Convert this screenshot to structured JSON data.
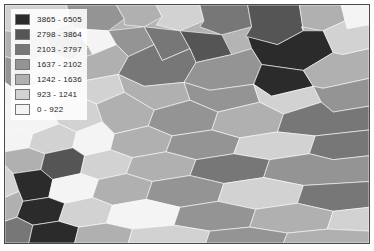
{
  "map": {
    "type": "choropleth",
    "classification": "graduated-color-7-class",
    "color_ramp": "grayscale-dark-to-light",
    "border_color": "#4a4a4a",
    "background_color": "#ffffff"
  },
  "legend": {
    "name": "map-legend",
    "items": [
      {
        "label": "3865 - 6505",
        "color": "#2b2b2b",
        "min": 3865,
        "max": 6505
      },
      {
        "label": "2798 - 3864",
        "color": "#555555",
        "min": 2798,
        "max": 3864
      },
      {
        "label": "2103 - 2797",
        "color": "#777777",
        "min": 2103,
        "max": 2797
      },
      {
        "label": "1637 - 2102",
        "color": "#949494",
        "min": 1637,
        "max": 2102
      },
      {
        "label": "1242 - 1636",
        "color": "#b0b0b0",
        "min": 1242,
        "max": 1636
      },
      {
        "label": "923 - 1241",
        "color": "#d2d2d2",
        "min": 923,
        "max": 1241
      },
      {
        "label": "0 - 922",
        "color": "#f4f4f4",
        "min": 0,
        "max": 922
      }
    ]
  },
  "chart_data": {
    "type": "map",
    "title": "",
    "legend_position": "top-left",
    "class_breaks": [
      0,
      922,
      923,
      1241,
      1242,
      1636,
      1637,
      2102,
      2103,
      2797,
      2798,
      3864,
      3865,
      6505
    ],
    "class_count": 7,
    "polygons": [
      {
        "c": 5,
        "p": "0,0 62,0 66,18 40,30 12,34 0,26"
      },
      {
        "c": 3,
        "p": "62,0 112,0 120,14 104,26 70,24 66,18"
      },
      {
        "c": 4,
        "p": "112,0 152,0 158,12 140,22 120,20 120,14"
      },
      {
        "c": 5,
        "p": "152,0 196,0 200,16 176,26 152,20 158,12"
      },
      {
        "c": 2,
        "p": "196,0 244,0 248,22 218,30 196,22 200,16"
      },
      {
        "c": 1,
        "p": "244,0 296,0 300,26 274,40 242,32 248,22"
      },
      {
        "c": 4,
        "p": "296,0 338,0 342,16 320,26 298,22 300,26"
      },
      {
        "c": 6,
        "p": "338,0 366,0 366,20 344,24 342,16"
      },
      {
        "c": 4,
        "p": "0,26 40,30 48,48 20,58 0,52"
      },
      {
        "c": 3,
        "p": "40,30 70,24 84,42 66,56 48,48"
      },
      {
        "c": 6,
        "p": "70,24 104,26 112,40 88,50 84,42"
      },
      {
        "c": 3,
        "p": "104,26 140,22 150,40 124,52 112,40"
      },
      {
        "c": 2,
        "p": "140,22 176,26 186,44 158,56 150,40"
      },
      {
        "c": 1,
        "p": "176,26 218,30 228,50 192,58 186,44"
      },
      {
        "c": 0,
        "p": "244,32 274,40 300,26 320,26 330,48 300,66 258,60 248,44"
      },
      {
        "c": 5,
        "p": "320,26 342,16 344,24 366,20 366,44 340,50 330,48"
      },
      {
        "c": 3,
        "p": "0,52 20,58 28,76 8,84 0,78"
      },
      {
        "c": 5,
        "p": "20,58 48,48 66,56 60,74 32,80 28,76"
      },
      {
        "c": 4,
        "p": "66,56 88,50 112,40 124,52 114,70 82,76 60,74"
      },
      {
        "c": 2,
        "p": "124,52 150,40 158,56 186,44 192,58 180,78 140,82 114,70"
      },
      {
        "c": 3,
        "p": "192,58 228,50 248,44 258,60 250,80 206,86 180,78"
      },
      {
        "c": 0,
        "p": "258,60 300,66 310,82 268,92 250,80"
      },
      {
        "c": 4,
        "p": "300,66 330,48 340,50 366,44 366,74 320,84 310,82"
      },
      {
        "c": 6,
        "p": "0,78 8,84 20,100 2,108 0,100"
      },
      {
        "c": 6,
        "p": "8,84 32,80 60,74 70,90 46,104 20,100"
      },
      {
        "c": 5,
        "p": "60,74 82,76 114,70 120,88 92,100 70,90"
      },
      {
        "c": 4,
        "p": "114,70 140,82 180,78 186,96 150,106 120,88"
      },
      {
        "c": 3,
        "p": "180,78 206,86 250,80 256,98 214,108 186,96"
      },
      {
        "c": 5,
        "p": "250,80 268,92 310,82 318,98 280,110 256,98"
      },
      {
        "c": 3,
        "p": "310,82 320,84 366,74 366,102 330,108 318,98"
      },
      {
        "c": 6,
        "p": "0,100 2,108 16,124 0,130"
      },
      {
        "c": 6,
        "p": "2,108 20,100 46,104 54,120 28,130 16,124"
      },
      {
        "c": 5,
        "p": "46,104 70,90 92,100 98,118 72,128 54,120"
      },
      {
        "c": 4,
        "p": "92,100 120,88 150,106 144,122 110,130 98,118"
      },
      {
        "c": 3,
        "p": "150,106 186,96 214,108 208,126 168,132 144,122"
      },
      {
        "c": 4,
        "p": "214,108 256,98 280,110 274,128 236,134 208,126"
      },
      {
        "c": 2,
        "p": "280,110 318,98 330,108 366,102 366,126 312,132 274,128"
      },
      {
        "c": 6,
        "p": "0,130 16,124 28,130 24,144 0,148"
      },
      {
        "c": 5,
        "p": "28,130 54,120 72,128 68,144 40,150 24,144"
      },
      {
        "c": 6,
        "p": "72,128 98,118 110,130 106,146 80,152 68,144"
      },
      {
        "c": 4,
        "p": "110,130 144,122 168,132 162,148 128,154 106,146"
      },
      {
        "c": 3,
        "p": "168,132 208,126 236,134 230,150 192,156 162,148"
      },
      {
        "c": 5,
        "p": "236,134 274,128 312,132 306,150 266,156 230,150"
      },
      {
        "c": 2,
        "p": "312,132 366,126 366,152 330,156 306,150"
      },
      {
        "c": 4,
        "p": "0,148 24,144 40,150 36,166 8,170 0,162"
      },
      {
        "c": 1,
        "p": "40,150 68,144 80,152 76,170 48,176 36,166"
      },
      {
        "c": 5,
        "p": "80,152 106,146 128,154 122,170 94,176 76,170"
      },
      {
        "c": 4,
        "p": "128,154 162,148 192,156 186,172 148,178 122,170"
      },
      {
        "c": 2,
        "p": "192,156 230,150 266,156 260,174 220,180 186,172"
      },
      {
        "c": 3,
        "p": "266,156 306,150 330,156 366,152 366,178 300,182 260,174"
      },
      {
        "c": 5,
        "p": "0,162 8,170 14,188 0,194"
      },
      {
        "c": 0,
        "p": "8,170 36,166 48,176 44,194 18,198 14,188"
      },
      {
        "c": 6,
        "p": "48,176 76,170 94,176 88,194 60,200 44,194"
      },
      {
        "c": 4,
        "p": "94,176 122,170 148,178 142,196 108,202 88,194"
      },
      {
        "c": 3,
        "p": "148,178 186,172 220,180 214,198 176,204 142,196"
      },
      {
        "c": 5,
        "p": "220,180 260,174 300,182 294,200 252,206 214,198"
      },
      {
        "c": 2,
        "p": "300,182 366,178 366,204 330,208 294,200"
      },
      {
        "c": 4,
        "p": "0,194 14,188 18,198 12,214 0,218"
      },
      {
        "c": 0,
        "p": "18,198 44,194 60,200 54,218 28,222 12,214"
      },
      {
        "c": 5,
        "p": "60,200 88,194 108,202 102,220 74,224 54,218"
      },
      {
        "c": 6,
        "p": "108,202 142,196 176,204 170,222 128,226 102,220"
      },
      {
        "c": 3,
        "p": "176,204 214,198 252,206 246,224 206,228 170,222"
      },
      {
        "c": 4,
        "p": "252,206 294,200 330,208 324,226 284,230 246,224"
      },
      {
        "c": 5,
        "p": "330,208 366,204 366,228 324,226"
      },
      {
        "c": 2,
        "p": "0,218 12,214 28,222 24,240 0,240"
      },
      {
        "c": 0,
        "p": "28,222 54,218 74,224 70,240 24,240"
      },
      {
        "c": 4,
        "p": "74,224 102,220 128,226 124,240 70,240"
      },
      {
        "c": 5,
        "p": "128,226 170,222 206,228 202,240 124,240"
      },
      {
        "c": 3,
        "p": "206,228 246,224 284,230 280,240 202,240"
      },
      {
        "c": 4,
        "p": "284,230 324,226 366,228 366,240 280,240"
      }
    ]
  }
}
